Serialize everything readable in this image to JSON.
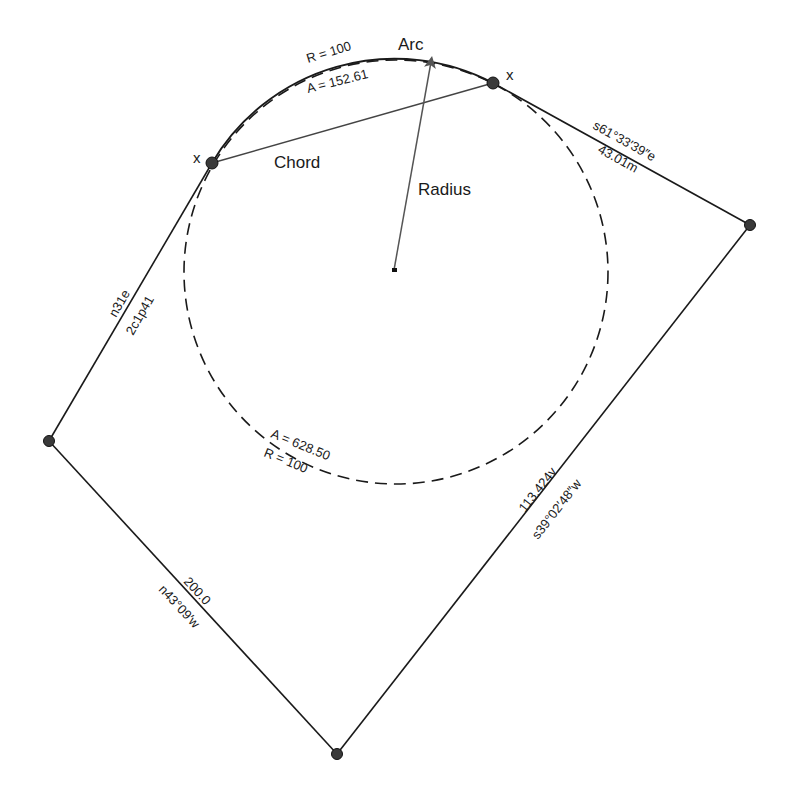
{
  "diagram": {
    "type": "survey-plat",
    "labels": {
      "arc": "Arc",
      "chord": "Chord",
      "radius": "Radius",
      "point_mark_left": "x",
      "point_mark_right": "x"
    },
    "arc_annotation": {
      "radius_text": "R = 100",
      "length_text": "A = 152.61"
    },
    "circle_annotation": {
      "length_text": "A = 628.50",
      "radius_text": "R = 100"
    },
    "boundary_lines": [
      {
        "id": "east-top",
        "bearing": "s61°33′39″e",
        "distance": "43.01m"
      },
      {
        "id": "east",
        "distance": "113.424v",
        "bearing": "s39°02′48″w"
      },
      {
        "id": "south-west",
        "distance": "200.0",
        "bearing": "n43°09′w"
      },
      {
        "id": "west",
        "bearing": "n31e",
        "distance": "2c1p41"
      }
    ],
    "colors": {
      "line": "#1a1a1a",
      "point": "#3a3a3a",
      "arrow": "#555555",
      "background": "#ffffff"
    }
  }
}
